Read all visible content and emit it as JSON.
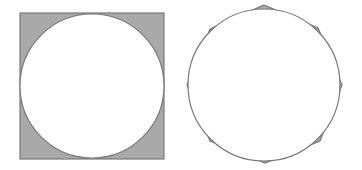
{
  "colors": {
    "background": "#ffffff",
    "shaded_fill": "#a9a9a9",
    "stroke": "#7a7a7a",
    "circle_fill": "#ffffff"
  },
  "figures": [
    {
      "name": "circle-inscribed-in-square",
      "square": {
        "x": 20,
        "y": 13,
        "width": 144,
        "height": 146
      },
      "circle": {
        "cx": 92,
        "cy": 86,
        "r": 72
      }
    },
    {
      "name": "circle-inscribed-in-octagon",
      "octagon_points": "264,5 318,28 342,85 320,141 265,163 210,141 187,85 210,29",
      "circle": {
        "cx": 264,
        "cy": 85,
        "r": 76
      }
    }
  ]
}
